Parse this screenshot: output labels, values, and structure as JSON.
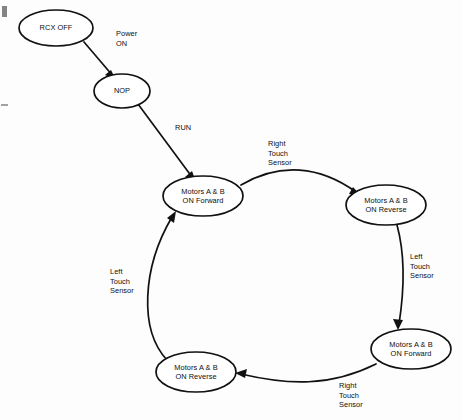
{
  "diagram": {
    "stroke_color": "#111111",
    "background_color": "#fdfdfd",
    "nodes": [
      {
        "id": "rcx-off",
        "label": "RCX OFF",
        "cx": 56,
        "cy": 28,
        "rx": 37,
        "ry": 18
      },
      {
        "id": "nop",
        "label": "NOP",
        "cx": 122,
        "cy": 91,
        "rx": 28,
        "ry": 17
      },
      {
        "id": "center-forward",
        "label": "Motors A & B\nON Forward",
        "cx": 203,
        "cy": 196,
        "rx": 40,
        "ry": 20
      },
      {
        "id": "right-reverse",
        "label": "Motors A & B\nON Reverse",
        "cx": 386,
        "cy": 205,
        "rx": 40,
        "ry": 20
      },
      {
        "id": "bottom-right-forward",
        "label": "Motors A & B\nON Forward",
        "cx": 411,
        "cy": 349,
        "rx": 40,
        "ry": 20
      },
      {
        "id": "bottom-left-reverse",
        "label": "Motors A & B\nON Reverse",
        "cx": 196,
        "cy": 372,
        "rx": 40,
        "ry": 20
      }
    ],
    "edges": [
      {
        "id": "power-on",
        "from": "rcx-off",
        "to": "nop",
        "label": "Power\nON",
        "label_x": 116,
        "label_y": 29
      },
      {
        "id": "run",
        "from": "nop",
        "to": "center-forward",
        "label": "RUN",
        "label_x": 175,
        "label_y": 123
      },
      {
        "id": "right-touch-top",
        "from": "center-forward",
        "to": "right-reverse",
        "label": "Right\nTouch\nSensor",
        "label_x": 268,
        "label_y": 139
      },
      {
        "id": "left-touch-right",
        "from": "right-reverse",
        "to": "bottom-right-forward",
        "label": "Left\nTouch\nSensor",
        "label_x": 410,
        "label_y": 252
      },
      {
        "id": "right-touch-bottom",
        "from": "bottom-right-forward",
        "to": "bottom-left-reverse",
        "label": "Right\nTouch\nSensor",
        "label_x": 339,
        "label_y": 381
      },
      {
        "id": "left-touch-left",
        "from": "bottom-left-reverse",
        "to": "center-forward",
        "label": "Left\nTouch\nSensor",
        "label_x": 110,
        "label_y": 267
      }
    ]
  }
}
